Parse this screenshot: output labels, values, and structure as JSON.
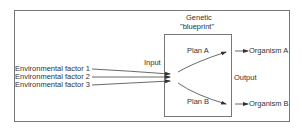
{
  "diagram": {
    "title_line1": "Genetic",
    "title_line2": "\"blueprint\"",
    "input_label": "Input",
    "output_label": "Output",
    "factors": [
      "Environmental factor 1",
      "Environmental factor 2",
      "Environmental factor 3"
    ],
    "plans": [
      "Plan A",
      "Plan B"
    ],
    "organisms": [
      "Organism A",
      "Organism B"
    ],
    "colors": {
      "line": "#555555",
      "text": "#333333",
      "background": "#ffffff"
    }
  }
}
